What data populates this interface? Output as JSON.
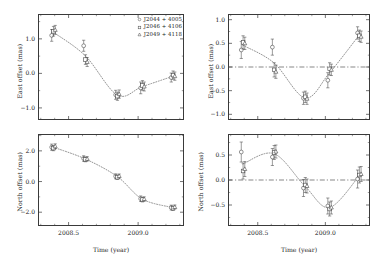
{
  "figure": {
    "title": "",
    "panel_count": 4
  },
  "legend": {
    "position": "top-right-of-panel-a",
    "entries": [
      {
        "marker": "circle-open-icon",
        "label": "J2044 + 4005"
      },
      {
        "marker": "square-open-icon",
        "label": "J2046 + 4106"
      },
      {
        "marker": "triangle-open-icon",
        "label": "J2049 + 4118"
      }
    ]
  },
  "axes": {
    "xlabel": "Time (year)",
    "ylabel_east": "East offset (mas)",
    "ylabel_north": "North offset (mas)",
    "xticks": [
      "2008.5",
      "2009.0"
    ],
    "xtick_values": [
      2008.5,
      2009.0
    ],
    "xlim": [
      2008.28,
      2009.33
    ],
    "yticks_a": [
      "1.0",
      "0.0",
      "-1.0"
    ],
    "yticks_b": [
      "1.0",
      "0.5",
      "0.0",
      "-0.5",
      "-1.0"
    ],
    "yticks_c": [
      "2.0",
      "0.0",
      "-2.0"
    ],
    "yticks_d": [
      "0.5",
      "0.0",
      "-0.5"
    ]
  },
  "chart_data": [
    {
      "id": "panel-a",
      "type": "scatter",
      "title": "",
      "xlabel": "",
      "ylabel": "East offset (mas)",
      "xlim": [
        2008.28,
        2009.33
      ],
      "ylim": [
        -1.35,
        1.72
      ],
      "grid": false,
      "zero_line": false,
      "x": [
        2008.39,
        2008.62,
        2008.85,
        2009.03,
        2009.25
      ],
      "series": [
        {
          "name": "J2044 + 4005",
          "marker": "circle",
          "values": [
            1.1,
            0.8,
            -0.62,
            -0.42,
            -0.12
          ],
          "errors": [
            0.17,
            0.16,
            0.13,
            0.17,
            0.13
          ]
        },
        {
          "name": "J2046 + 4106",
          "marker": "square",
          "values": [
            1.22,
            0.4,
            -0.66,
            -0.35,
            -0.05
          ],
          "errors": [
            0.14,
            0.14,
            0.12,
            0.14,
            0.12
          ]
        },
        {
          "name": "J2049 + 4118",
          "marker": "triangle",
          "values": [
            1.26,
            0.33,
            -0.6,
            -0.38,
            -0.08
          ],
          "errors": [
            0.13,
            0.13,
            0.12,
            0.13,
            0.12
          ]
        }
      ],
      "model_curve": {
        "style": "dotted",
        "description": "parallax + proper motion fit"
      }
    },
    {
      "id": "panel-b",
      "type": "scatter",
      "title": "",
      "xlabel": "",
      "ylabel": "East offset (mas)",
      "xlim": [
        2008.28,
        2009.33
      ],
      "ylim": [
        -1.12,
        1.12
      ],
      "grid": false,
      "zero_line": true,
      "x": [
        2008.39,
        2008.62,
        2008.85,
        2009.03,
        2009.25
      ],
      "series": [
        {
          "name": "J2044 + 4005",
          "marker": "circle",
          "values": [
            0.36,
            0.42,
            -0.66,
            -0.28,
            0.72
          ],
          "errors": [
            0.18,
            0.17,
            0.13,
            0.16,
            0.13
          ]
        },
        {
          "name": "J2046 + 4106",
          "marker": "square",
          "values": [
            0.52,
            -0.06,
            -0.63,
            -0.04,
            0.66
          ],
          "errors": [
            0.14,
            0.15,
            0.12,
            0.13,
            0.12
          ]
        },
        {
          "name": "J2049 + 4118",
          "marker": "triangle",
          "values": [
            0.5,
            -0.1,
            -0.67,
            -0.06,
            0.64
          ],
          "errors": [
            0.13,
            0.14,
            0.12,
            0.12,
            0.12
          ]
        }
      ],
      "model_curve": {
        "style": "dotted",
        "description": "parallax signature"
      }
    },
    {
      "id": "panel-c",
      "type": "scatter",
      "title": "",
      "xlabel": "Time (year)",
      "ylabel": "North offset (mas)",
      "xlim": [
        2008.28,
        2009.33
      ],
      "ylim": [
        -2.9,
        3.1
      ],
      "grid": false,
      "zero_line": false,
      "x": [
        2008.39,
        2008.62,
        2008.85,
        2009.03,
        2009.25
      ],
      "series": [
        {
          "name": "J2044 + 4005",
          "marker": "circle",
          "values": [
            2.24,
            1.5,
            0.34,
            -1.12,
            -1.7
          ],
          "errors": [
            0.2,
            0.18,
            0.16,
            0.18,
            0.16
          ]
        },
        {
          "name": "J2046 + 4106",
          "marker": "square",
          "values": [
            2.18,
            1.44,
            0.28,
            -1.18,
            -1.74
          ],
          "errors": [
            0.17,
            0.15,
            0.14,
            0.15,
            0.14
          ]
        },
        {
          "name": "J2049 + 4118",
          "marker": "triangle",
          "values": [
            2.3,
            1.48,
            0.36,
            -1.14,
            -1.66
          ],
          "errors": [
            0.16,
            0.14,
            0.13,
            0.14,
            0.13
          ]
        }
      ],
      "model_curve": {
        "style": "dotted",
        "description": "parallax + proper motion fit"
      }
    },
    {
      "id": "panel-d",
      "type": "scatter",
      "title": "",
      "xlabel": "Time (year)",
      "ylabel": "North offset (mas)",
      "xlim": [
        2008.28,
        2009.33
      ],
      "ylim": [
        -0.92,
        0.92
      ],
      "grid": false,
      "zero_line": true,
      "x": [
        2008.39,
        2008.62,
        2008.85,
        2009.03,
        2009.25
      ],
      "series": [
        {
          "name": "J2044 + 4005",
          "marker": "circle",
          "values": [
            0.56,
            0.46,
            -0.16,
            -0.52,
            0.02
          ],
          "errors": [
            0.2,
            0.17,
            0.17,
            0.16,
            0.18
          ]
        },
        {
          "name": "J2046 + 4106",
          "marker": "square",
          "values": [
            0.18,
            0.55,
            -0.1,
            -0.58,
            0.1
          ],
          "errors": [
            0.16,
            0.14,
            0.15,
            0.14,
            0.16
          ]
        },
        {
          "name": "J2049 + 4118",
          "marker": "triangle",
          "values": [
            0.22,
            0.57,
            -0.12,
            -0.55,
            0.12
          ],
          "errors": [
            0.15,
            0.13,
            0.14,
            0.13,
            0.15
          ]
        }
      ],
      "model_curve": {
        "style": "dotted",
        "description": "parallax signature"
      }
    }
  ]
}
